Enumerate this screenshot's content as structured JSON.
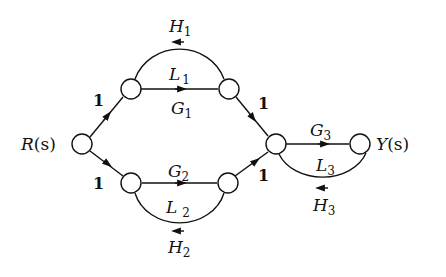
{
  "diagram": {
    "type": "signal-flow-graph",
    "input_label": "R(s)",
    "output_label": "Y(s)",
    "nodes": [
      {
        "id": "R",
        "label": "R(s)"
      },
      {
        "id": "n1",
        "label": ""
      },
      {
        "id": "n2",
        "label": ""
      },
      {
        "id": "n3",
        "label": ""
      },
      {
        "id": "n4",
        "label": ""
      },
      {
        "id": "n5",
        "label": ""
      },
      {
        "id": "Y",
        "label": "Y(s)"
      }
    ],
    "edges": [
      {
        "from": "R",
        "to": "n1",
        "gain": "1"
      },
      {
        "from": "R",
        "to": "n3",
        "gain": "1"
      },
      {
        "from": "n1",
        "to": "n2",
        "gain": "G1"
      },
      {
        "from": "n2",
        "to": "n1",
        "gain": "H1"
      },
      {
        "from": "n3",
        "to": "n4",
        "gain": "G2"
      },
      {
        "from": "n4",
        "to": "n3",
        "gain": "H2"
      },
      {
        "from": "n2",
        "to": "n5",
        "gain": "1"
      },
      {
        "from": "n4",
        "to": "n5",
        "gain": "1"
      },
      {
        "from": "n5",
        "to": "Y",
        "gain": "G3"
      },
      {
        "from": "Y",
        "to": "n5",
        "gain": "H3"
      }
    ],
    "loops": [
      "L1",
      "L2",
      "L3"
    ],
    "labels": {
      "R": "R",
      "R_arg": "(s)",
      "Y": "Y",
      "Y_arg": "(s)",
      "one": "1",
      "H": "H",
      "L": "L",
      "G": "G",
      "s1": "1",
      "s2": "2",
      "s3": "3"
    }
  }
}
